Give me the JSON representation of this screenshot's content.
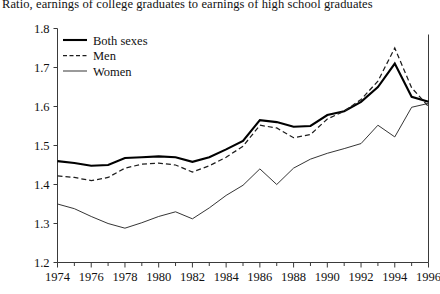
{
  "chart_data": {
    "type": "line",
    "title": "Ratio, earnings of college graduates to earnings of high school graduates",
    "xlabel": "",
    "ylabel": "",
    "xlim": [
      1974,
      1996
    ],
    "ylim": [
      1.2,
      1.8
    ],
    "grid": false,
    "legend_position": "top-left",
    "y_ticks": [
      "1.2",
      "1.3",
      "1.4",
      "1.5",
      "1.6",
      "1.7",
      "1.8"
    ],
    "y_tick_values": [
      1.2,
      1.3,
      1.4,
      1.5,
      1.6,
      1.7,
      1.8
    ],
    "x_ticks": [
      "1974",
      "1976",
      "1978",
      "1980",
      "1982",
      "1984",
      "1986",
      "1988",
      "1990",
      "1992",
      "1994",
      "1996"
    ],
    "x_tick_values": [
      1974,
      1976,
      1978,
      1980,
      1982,
      1984,
      1986,
      1988,
      1990,
      1992,
      1994,
      1996
    ],
    "x_minor_ticks": [
      1975,
      1977,
      1979,
      1981,
      1983,
      1985,
      1987,
      1989,
      1991,
      1993,
      1995
    ],
    "x": [
      1974,
      1975,
      1976,
      1977,
      1978,
      1979,
      1980,
      1981,
      1982,
      1983,
      1984,
      1985,
      1986,
      1987,
      1988,
      1989,
      1990,
      1991,
      1992,
      1993,
      1994,
      1995,
      1996
    ],
    "series": [
      {
        "name": "Both sexes",
        "style": "solid-thick",
        "color": "#000000",
        "values": [
          1.46,
          1.455,
          1.448,
          1.45,
          1.468,
          1.47,
          1.472,
          1.47,
          1.458,
          1.47,
          1.49,
          1.512,
          1.565,
          1.56,
          1.548,
          1.55,
          1.578,
          1.588,
          1.612,
          1.65,
          1.71,
          1.625,
          1.612
        ]
      },
      {
        "name": "Men",
        "style": "dashed",
        "color": "#1d1d1d",
        "values": [
          1.422,
          1.418,
          1.41,
          1.418,
          1.442,
          1.452,
          1.455,
          1.45,
          1.432,
          1.448,
          1.47,
          1.498,
          1.552,
          1.545,
          1.52,
          1.528,
          1.568,
          1.588,
          1.618,
          1.665,
          1.75,
          1.648,
          1.6
        ]
      },
      {
        "name": "Women",
        "style": "solid-thin",
        "color": "#2a2a2a",
        "values": [
          1.35,
          1.338,
          1.318,
          1.3,
          1.288,
          1.302,
          1.318,
          1.33,
          1.312,
          1.34,
          1.372,
          1.398,
          1.44,
          1.4,
          1.442,
          1.465,
          1.48,
          1.492,
          1.505,
          1.552,
          1.522,
          1.598,
          1.608
        ]
      }
    ]
  }
}
